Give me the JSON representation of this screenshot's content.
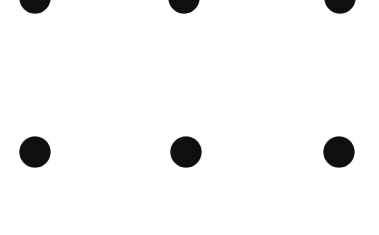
{
  "canvas": {
    "width": 379,
    "height": 235,
    "background_color": "#ffffff"
  },
  "pattern": {
    "type": "polka-dot-grid",
    "description": "six solid dark dots, 3 columns x 2 rows, top row clipped by top edge",
    "dot_color": "#0f0f0f",
    "dot_diameter_px": 31,
    "rows": 2,
    "columns": 3,
    "dots": [
      {
        "cx": 35,
        "cy": -2,
        "clipped": true
      },
      {
        "cx": 184,
        "cy": -2,
        "clipped": true
      },
      {
        "cx": 340,
        "cy": -2,
        "clipped": true
      },
      {
        "cx": 35,
        "cy": 152,
        "clipped": false
      },
      {
        "cx": 186,
        "cy": 152,
        "clipped": false
      },
      {
        "cx": 339,
        "cy": 152,
        "clipped": false
      }
    ]
  }
}
